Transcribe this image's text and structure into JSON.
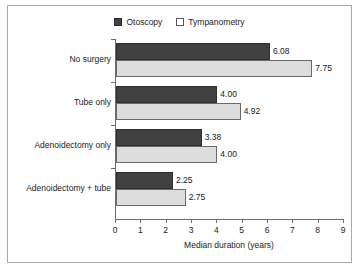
{
  "chart_data": {
    "type": "bar",
    "orientation": "horizontal",
    "title": "",
    "xlabel": "Median duration (years)",
    "ylabel": "",
    "xlim": [
      0,
      9
    ],
    "xticks": [
      0,
      1,
      2,
      3,
      4,
      5,
      6,
      7,
      8,
      9
    ],
    "grid": false,
    "legend_position": "top-center",
    "categories": [
      "No surgery",
      "Tube only",
      "Adenoidectomy only",
      "Adenoidectomy + tube"
    ],
    "series": [
      {
        "name": "Otoscopy",
        "color": "#414141",
        "swatch": "filled-square",
        "values": [
          6.08,
          4.0,
          3.38,
          2.25
        ],
        "labels": [
          "6.08",
          "4.00",
          "3.38",
          "2.25"
        ]
      },
      {
        "name": "Tympanometry",
        "color": "#dddddd",
        "swatch": "open-square",
        "values": [
          7.75,
          4.92,
          4.0,
          2.75
        ],
        "labels": [
          "7.75",
          "4.92",
          "4.00",
          "2.75"
        ]
      }
    ]
  },
  "colors": {
    "series_dark": "#414141",
    "series_light": "#dddddd",
    "axis": "#6d6d6d",
    "border": "#a9a9a9",
    "text": "#222222",
    "background": "#ffffff"
  }
}
